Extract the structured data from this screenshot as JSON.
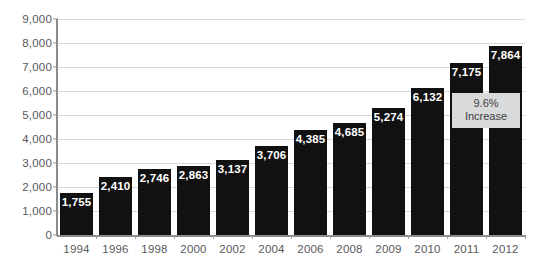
{
  "chart_data": {
    "type": "bar",
    "title": "",
    "subtitle": "",
    "xlabel": "",
    "ylabel": "",
    "categories": [
      "1994",
      "1996",
      "1998",
      "2000",
      "2002",
      "2004",
      "2006",
      "2008",
      "2009",
      "2010",
      "2011",
      "2012"
    ],
    "values": [
      1755,
      2410,
      2746,
      2863,
      3137,
      3706,
      4385,
      4685,
      5274,
      6132,
      7175,
      7864
    ],
    "value_labels": [
      "1,755",
      "2,410",
      "2,746",
      "2,863",
      "3,137",
      "3,706",
      "4,385",
      "4,685",
      "5,274",
      "6,132",
      "7,175",
      "7,864"
    ],
    "ylim": [
      0,
      9000
    ],
    "ytick_values": [
      0,
      1000,
      2000,
      3000,
      4000,
      5000,
      6000,
      7000,
      8000,
      9000
    ],
    "ytick_labels": [
      "0",
      "1,000",
      "2,000",
      "3,000",
      "4,000",
      "5,000",
      "6,000",
      "7,000",
      "8,000",
      "9,000"
    ],
    "grid": true,
    "legend": null,
    "legend_position": "none",
    "series": [
      {
        "name": "",
        "values": [
          1755,
          2410,
          2746,
          2863,
          3137,
          3706,
          4385,
          4685,
          5274,
          6132,
          7175,
          7864
        ],
        "color": "#111111"
      }
    ],
    "annotations": [
      {
        "line1": "9.6%",
        "line2": "Increase",
        "attached_to": [
          "2011",
          "2012"
        ],
        "background": "#d9dadb",
        "text_color": "#404042"
      }
    ],
    "colors": {
      "bar": "#111111",
      "value_label": "#ffffff",
      "gridline": "#d7d8da",
      "axis": "#8a8c8e",
      "tick_label": "#58595b",
      "background": "#ffffff",
      "annotation_bg": "#d9dadb",
      "annotation_text": "#404042"
    }
  }
}
